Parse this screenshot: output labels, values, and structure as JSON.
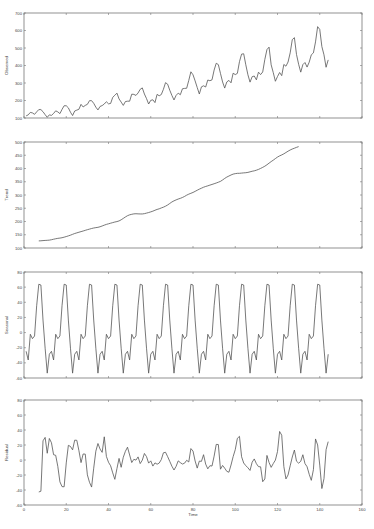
{
  "chart_data": {
    "type": "line",
    "title": "",
    "xlabel": "Time",
    "xlim": [
      0,
      160
    ],
    "x_ticks": [
      0,
      20,
      40,
      60,
      80,
      100,
      120,
      140,
      160
    ],
    "grid": false,
    "legend": null,
    "panels": [
      {
        "name": "Observed",
        "ylabel": "Observed",
        "ylim": [
          100,
          700
        ],
        "y_ticks": [
          100,
          200,
          300,
          400,
          500,
          600,
          700
        ],
        "x_start": 1,
        "values": [
          112,
          118,
          132,
          129,
          121,
          135,
          148,
          148,
          136,
          119,
          104,
          118,
          115,
          126,
          141,
          135,
          125,
          149,
          170,
          170,
          158,
          133,
          114,
          140,
          145,
          150,
          178,
          163,
          172,
          178,
          199,
          199,
          184,
          162,
          146,
          166,
          171,
          180,
          193,
          181,
          183,
          218,
          230,
          242,
          209,
          191,
          172,
          194,
          196,
          196,
          236,
          235,
          229,
          243,
          264,
          272,
          237,
          211,
          180,
          201,
          204,
          188,
          235,
          227,
          234,
          264,
          302,
          293,
          259,
          229,
          203,
          229,
          242,
          233,
          267,
          269,
          270,
          315,
          364,
          347,
          312,
          274,
          237,
          278,
          284,
          277,
          317,
          313,
          318,
          374,
          413,
          405,
          355,
          306,
          271,
          306,
          315,
          301,
          356,
          348,
          355,
          422,
          465,
          467,
          404,
          347,
          305,
          336,
          340,
          318,
          362,
          348,
          363,
          435,
          491,
          505,
          404,
          359,
          310,
          337,
          360,
          342,
          406,
          396,
          420,
          472,
          548,
          559,
          463,
          407,
          362,
          405,
          417,
          391,
          419,
          461,
          472,
          535,
          622,
          606,
          508,
          461,
          390,
          432
        ]
      },
      {
        "name": "Trend",
        "ylabel": "Trend",
        "ylim": [
          100,
          500
        ],
        "y_ticks": [
          100,
          150,
          200,
          250,
          300,
          350,
          400,
          450,
          500
        ],
        "x_start": 7,
        "values": [
          126.8,
          127.2,
          127.96,
          128.58,
          129.0,
          129.75,
          131.25,
          133.08,
          134.92,
          136.42,
          137.42,
          138.75,
          140.92,
          143.17,
          145.71,
          148.42,
          151.54,
          154.71,
          157.12,
          159.54,
          161.83,
          164.12,
          166.67,
          169.08,
          171.25,
          173.58,
          175.46,
          176.83,
          178.04,
          180.17,
          183.12,
          186.21,
          189.04,
          191.29,
          193.58,
          195.83,
          198.04,
          199.75,
          202.21,
          206.42,
          211.71,
          217.04,
          221.92,
          225.12,
          227.12,
          228.79,
          229.29,
          228.79,
          228.5,
          228.46,
          229.62,
          231.71,
          233.83,
          236.33,
          239.0,
          242.5,
          245.54,
          247.88,
          251.12,
          254.12,
          257.88,
          262.33,
          268.04,
          273.67,
          277.96,
          281.5,
          284.75,
          287.42,
          290.67,
          294.62,
          299.33,
          303.21,
          306.42,
          309.62,
          313.75,
          318.04,
          322.08,
          325.71,
          329.33,
          332.17,
          334.58,
          337.29,
          339.83,
          342.58,
          345.25,
          348.25,
          351.46,
          356.67,
          362.5,
          367.58,
          371.58,
          375.5,
          378.83,
          380.58,
          381.75,
          381.88,
          382.71,
          383.42,
          384.12,
          385.33,
          387.42,
          389.58,
          391.17,
          393.62,
          396.62,
          400.33,
          404.25,
          408.67,
          414.08,
          420.17,
          426.08,
          431.5,
          437.42,
          443.12,
          447.58,
          451.21,
          455.33,
          460.25,
          465.33,
          469.79,
          473.58,
          476.58,
          479.75,
          482.62
        ]
      },
      {
        "name": "Seasonal",
        "ylabel": "Seasonal",
        "ylim": [
          -60,
          80
        ],
        "y_ticks": [
          -60,
          -40,
          -20,
          0,
          20,
          40,
          60,
          80
        ],
        "x_start": 1,
        "pattern": [
          -24.75,
          -36.19,
          -2.24,
          -8.04,
          -4.51,
          35.4,
          63.83,
          62.82,
          16.52,
          -20.64,
          -53.59,
          -28.62
        ],
        "values": [
          -24.75,
          -36.19,
          -2.24,
          -8.04,
          -4.51,
          35.4,
          63.83,
          62.82,
          16.52,
          -20.64,
          -53.59,
          -28.62,
          -24.75,
          -36.19,
          -2.24,
          -8.04,
          -4.51,
          35.4,
          63.83,
          62.82,
          16.52,
          -20.64,
          -53.59,
          -28.62,
          -24.75,
          -36.19,
          -2.24,
          -8.04,
          -4.51,
          35.4,
          63.83,
          62.82,
          16.52,
          -20.64,
          -53.59,
          -28.62,
          -24.75,
          -36.19,
          -2.24,
          -8.04,
          -4.51,
          35.4,
          63.83,
          62.82,
          16.52,
          -20.64,
          -53.59,
          -28.62,
          -24.75,
          -36.19,
          -2.24,
          -8.04,
          -4.51,
          35.4,
          63.83,
          62.82,
          16.52,
          -20.64,
          -53.59,
          -28.62,
          -24.75,
          -36.19,
          -2.24,
          -8.04,
          -4.51,
          35.4,
          63.83,
          62.82,
          16.52,
          -20.64,
          -53.59,
          -28.62,
          -24.75,
          -36.19,
          -2.24,
          -8.04,
          -4.51,
          35.4,
          63.83,
          62.82,
          16.52,
          -20.64,
          -53.59,
          -28.62,
          -24.75,
          -36.19,
          -2.24,
          -8.04,
          -4.51,
          35.4,
          63.83,
          62.82,
          16.52,
          -20.64,
          -53.59,
          -28.62,
          -24.75,
          -36.19,
          -2.24,
          -8.04,
          -4.51,
          35.4,
          63.83,
          62.82,
          16.52,
          -20.64,
          -53.59,
          -28.62,
          -24.75,
          -36.19,
          -2.24,
          -8.04,
          -4.51,
          35.4,
          63.83,
          62.82,
          16.52,
          -20.64,
          -53.59,
          -28.62,
          -24.75,
          -36.19,
          -2.24,
          -8.04,
          -4.51,
          35.4,
          63.83,
          62.82,
          16.52,
          -20.64,
          -53.59,
          -28.62,
          -24.75,
          -36.19,
          -2.24,
          -8.04,
          -4.51,
          35.4,
          63.83,
          62.82,
          16.52,
          -20.64,
          -53.59,
          -28.62
        ]
      },
      {
        "name": "Residual",
        "ylabel": "Residual",
        "ylim": [
          -60,
          80
        ],
        "y_ticks": [
          -60,
          -40,
          -20,
          0,
          20,
          40,
          60,
          80
        ],
        "x_start": 7,
        "values": [
          -42.63,
          -41.64,
          25.56,
          30.11,
          8.99,
          28.7,
          22.99,
          7.05,
          6.24,
          -8.53,
          -29.12,
          -35.48,
          -35.75,
          -3.89,
          19.56,
          18.05,
          13.52,
          26.44,
          26.25,
          12.36,
          -3.47,
          8.03,
          7.84,
          -19.85,
          -29.75,
          -36.09,
          -10.88,
          11.77,
          22.0,
          14.6,
          10.18,
          30.9,
          4.81,
          -3.03,
          -7.72,
          -17.16,
          -25.79,
          -11.46,
          2.11,
          -9.75,
          3.62,
          11.6,
          17.08,
          6.69,
          -3.39,
          0.92,
          -0.15,
          4.13,
          -4.77,
          -0.2,
          8.71,
          4.49,
          -4.15,
          -1.15,
          -8.11,
          -3.86,
          -5.61,
          -4.12,
          0.58,
          9.6,
          10.29,
          4.48,
          -1.8,
          -8.26,
          -13.36,
          -8.48,
          -1.15,
          -3.52,
          -5.4,
          -4.25,
          -0.38,
          -2.63,
          15.24,
          11.93,
          -1.31,
          -10.81,
          -1.43,
          -1.81,
          7.07,
          -5.48,
          -11.78,
          -7.63,
          -8.05,
          5.17,
          20.81,
          20.59,
          -12.25,
          -7.28,
          -10.9,
          -15.13,
          -16.29,
          -6.67,
          4.45,
          13.76,
          28.91,
          31.54,
          4.38,
          -4.03,
          -7.55,
          -10.36,
          -13.9,
          -2.93,
          1.43,
          -4.87,
          -8.87,
          -9.11,
          -28.95,
          -25.33,
          6.09,
          -3.29,
          -9.82,
          -4.74,
          -0.16,
          11.3,
          38.02,
          33.09,
          -8.66,
          -25.23,
          -19.95,
          -7.73,
          4.0,
          13.31,
          -1.61,
          -4.21,
          -1.79,
          7.02,
          -4.7,
          -8.97,
          -19.02,
          -27.12,
          -12.91,
          28.08,
          20.07,
          -6.79,
          -38.08,
          -24.93,
          13.79,
          24.46
        ]
      }
    ]
  }
}
